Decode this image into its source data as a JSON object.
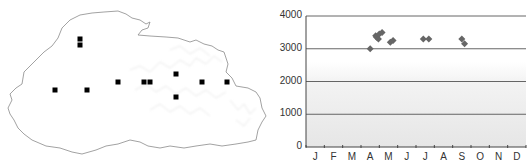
{
  "map": {
    "marker_color": "#000000",
    "outline_color": "#8a8a8a",
    "markers": [
      {
        "x": 80,
        "y": 39
      },
      {
        "x": 80,
        "y": 45
      },
      {
        "x": 55,
        "y": 90
      },
      {
        "x": 87,
        "y": 90
      },
      {
        "x": 118,
        "y": 82
      },
      {
        "x": 144,
        "y": 82
      },
      {
        "x": 150,
        "y": 82
      },
      {
        "x": 176,
        "y": 74
      },
      {
        "x": 176,
        "y": 97
      },
      {
        "x": 202,
        "y": 82
      },
      {
        "x": 227,
        "y": 82
      }
    ]
  },
  "chart_data": {
    "type": "scatter",
    "title": "",
    "xlabel": "",
    "ylabel": "",
    "categories": [
      "J",
      "F",
      "M",
      "A",
      "M",
      "J",
      "J",
      "A",
      "S",
      "O",
      "N",
      "D"
    ],
    "yticks": [
      0,
      1000,
      2000,
      3000,
      4000
    ],
    "ylim": [
      0,
      4000
    ],
    "grid": true,
    "legend": null,
    "marker": "diamond",
    "marker_color": "#666666",
    "points": [
      {
        "month": 4.0,
        "value": 3000
      },
      {
        "month": 4.3,
        "value": 3400
      },
      {
        "month": 4.35,
        "value": 3350
      },
      {
        "month": 4.45,
        "value": 3300
      },
      {
        "month": 4.5,
        "value": 3450
      },
      {
        "month": 4.65,
        "value": 3500
      },
      {
        "month": 5.1,
        "value": 3200
      },
      {
        "month": 5.25,
        "value": 3250
      },
      {
        "month": 6.9,
        "value": 3300
      },
      {
        "month": 7.2,
        "value": 3300
      },
      {
        "month": 9.0,
        "value": 3300
      },
      {
        "month": 9.15,
        "value": 3150
      }
    ]
  }
}
